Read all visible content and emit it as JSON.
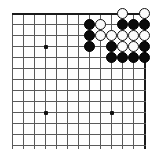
{
  "figure": {
    "kind": "go-board-diagram"
  },
  "board": {
    "background_color": "#ffffff",
    "grid_color": "#5a5a5a",
    "edge_color": "#1a1a1a",
    "cell_size": 11,
    "origin_x": 12,
    "origin_y": 13,
    "columns": 13,
    "rows": 13,
    "edges": {
      "top": true,
      "right": true,
      "left": false,
      "bottom": false
    },
    "star_points": [
      {
        "col": 3,
        "row": 3
      },
      {
        "col": 3,
        "row": 9
      },
      {
        "col": 9,
        "row": 9
      }
    ]
  },
  "stones": {
    "black_color": "#0b0b0b",
    "white_color": "#fbfbfb",
    "items": [
      {
        "col": 10,
        "row": 0,
        "color": "white"
      },
      {
        "col": 12,
        "row": 0,
        "color": "white"
      },
      {
        "col": 7,
        "row": 1,
        "color": "black"
      },
      {
        "col": 8,
        "row": 1,
        "color": "white"
      },
      {
        "col": 10,
        "row": 1,
        "color": "black"
      },
      {
        "col": 11,
        "row": 1,
        "color": "black"
      },
      {
        "col": 12,
        "row": 1,
        "color": "black"
      },
      {
        "col": 7,
        "row": 2,
        "color": "black"
      },
      {
        "col": 8,
        "row": 2,
        "color": "white"
      },
      {
        "col": 9,
        "row": 2,
        "color": "white"
      },
      {
        "col": 10,
        "row": 2,
        "color": "white"
      },
      {
        "col": 11,
        "row": 2,
        "color": "white"
      },
      {
        "col": 12,
        "row": 2,
        "color": "white"
      },
      {
        "col": 7,
        "row": 3,
        "color": "black"
      },
      {
        "col": 9,
        "row": 3,
        "color": "black"
      },
      {
        "col": 10,
        "row": 3,
        "color": "white"
      },
      {
        "col": 11,
        "row": 3,
        "color": "white"
      },
      {
        "col": 12,
        "row": 3,
        "color": "black"
      },
      {
        "col": 9,
        "row": 4,
        "color": "black"
      },
      {
        "col": 10,
        "row": 4,
        "color": "black"
      },
      {
        "col": 11,
        "row": 4,
        "color": "black"
      },
      {
        "col": 12,
        "row": 4,
        "color": "black"
      }
    ]
  }
}
